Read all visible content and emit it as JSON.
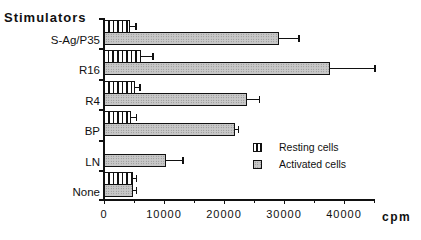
{
  "chart_data": {
    "type": "bar",
    "orientation": "horizontal",
    "title": "",
    "ylabel": "Stimulators",
    "xlabel": "cpm",
    "categories": [
      "S-Ag/P35",
      "R16",
      "R4",
      "BP",
      "LN",
      "None"
    ],
    "series": [
      {
        "name": "Resting cells",
        "pattern": "vertical-stripes",
        "values": [
          4300,
          6200,
          5200,
          4500,
          0,
          4800
        ],
        "errors": [
          1000,
          2000,
          800,
          900,
          0,
          600
        ]
      },
      {
        "name": "Activated cells",
        "pattern": "stippled-gray",
        "values": [
          29200,
          37700,
          23900,
          21900,
          10400,
          4800
        ],
        "errors": [
          3300,
          7500,
          2000,
          500,
          2800,
          600
        ]
      }
    ],
    "xlim": [
      0,
      45000
    ],
    "xticks": [
      0,
      10000,
      20000,
      30000,
      40000
    ],
    "xtick_labels": [
      "0",
      "10000",
      "20000",
      "30000",
      "40000"
    ],
    "minor_xticks": [
      5000,
      15000,
      25000,
      35000,
      45000
    ],
    "grid": false,
    "legend_position": "lower-right inside plot"
  },
  "axis": {
    "y_title": "Stimulators",
    "x_unit": "cpm",
    "x_tick_labels": [
      "0",
      "10000",
      "20000",
      "30000",
      "40000"
    ]
  },
  "categories": [
    "S-Ag/P35",
    "R16",
    "R4",
    "BP",
    "LN",
    "None"
  ],
  "legend": {
    "items": [
      {
        "label": "Resting cells"
      },
      {
        "label": "Activated cells"
      }
    ]
  }
}
